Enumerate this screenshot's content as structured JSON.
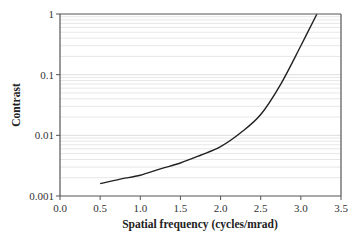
{
  "chart_data": {
    "type": "line",
    "title": "",
    "xlabel": "Spatial frequency (cycles/mrad)",
    "ylabel": "Contrast",
    "xlim": [
      0,
      3.5
    ],
    "ylim": [
      0.001,
      1
    ],
    "yscale": "log",
    "grid": "horizontal minor and major (log decades)",
    "legend": "none",
    "x_ticks": [
      0.0,
      0.5,
      1.0,
      1.5,
      2.0,
      2.5,
      3.0,
      3.5
    ],
    "x_tick_labels": [
      "0.0",
      "0.5",
      "1.0",
      "1.5",
      "2.0",
      "2.5",
      "3.0",
      "3.5"
    ],
    "y_ticks": [
      0.001,
      0.01,
      0.1,
      1
    ],
    "y_tick_labels": [
      "0.001",
      "0.01",
      "0.1",
      "1"
    ],
    "series": [
      {
        "name": "Contrast threshold",
        "color": "#222222",
        "x": [
          0.5,
          0.75,
          1.0,
          1.25,
          1.5,
          1.75,
          2.0,
          2.25,
          2.5,
          2.75,
          3.0,
          3.2
        ],
        "y": [
          0.0016,
          0.0019,
          0.0022,
          0.0028,
          0.0035,
          0.0047,
          0.0065,
          0.011,
          0.022,
          0.07,
          0.3,
          1.0
        ]
      }
    ]
  },
  "colors": {
    "axis": "#555555",
    "grid": "#dddddd",
    "line": "#222222"
  }
}
